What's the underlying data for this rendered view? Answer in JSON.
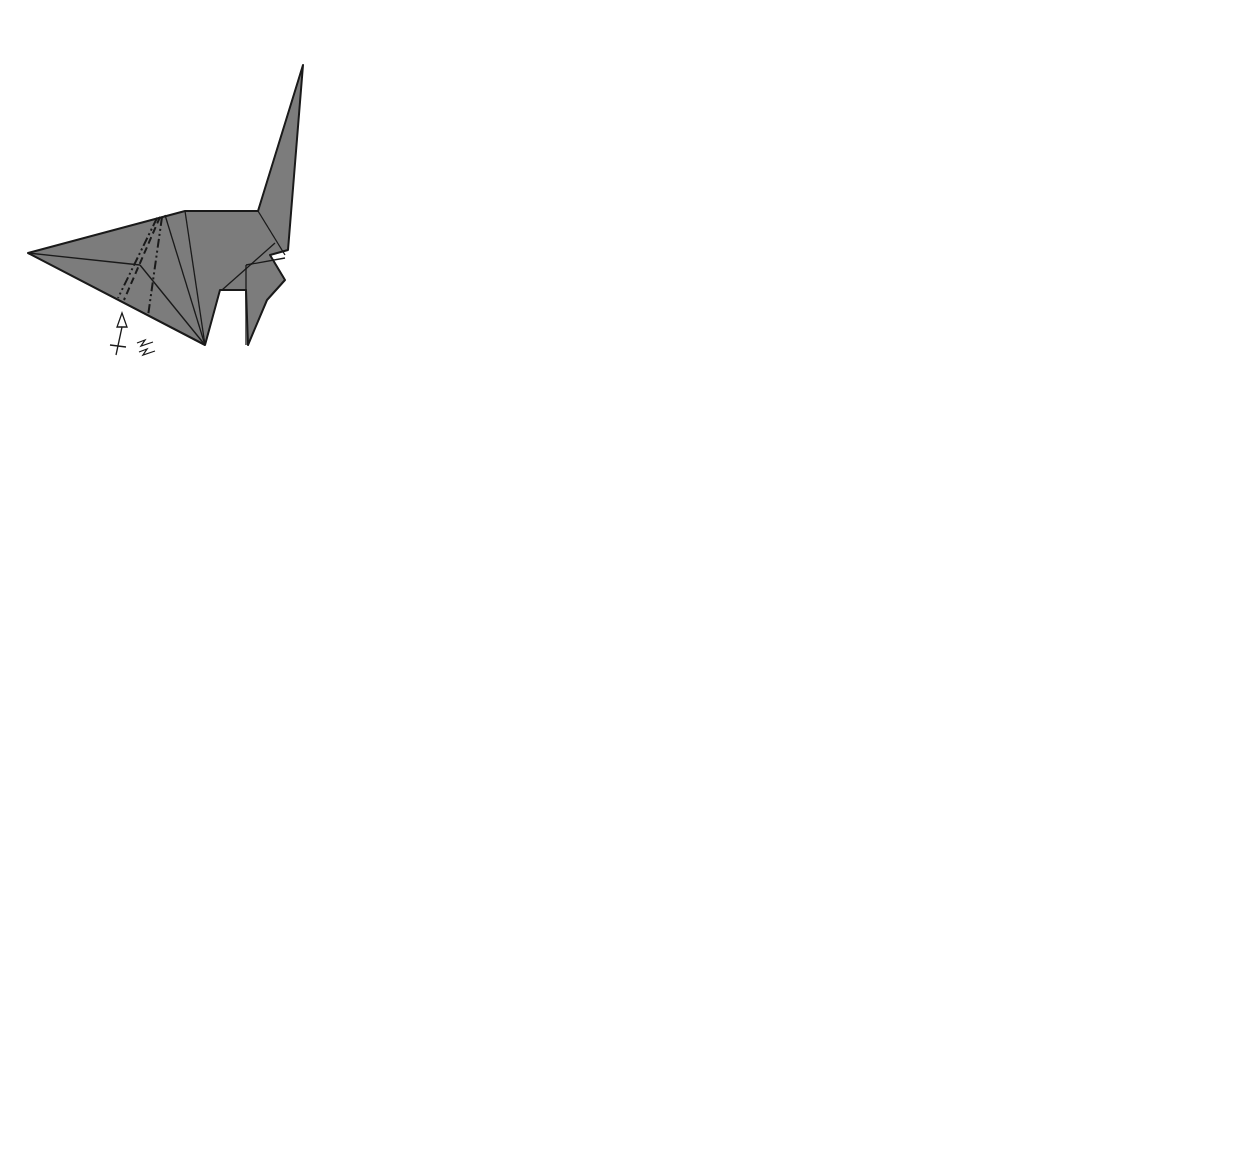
{
  "steps": [
    {
      "number": "40.",
      "label": "Create steps"
    },
    {
      "number": "41.",
      "label": "Push in"
    },
    {
      "number": "42.",
      "label": "Fold in"
    },
    {
      "number": "43.",
      "label": "Give shape"
    },
    {
      "number": "44.",
      "label": "Shape head"
    },
    {
      "number": "45.",
      "label": "Fold head"
    },
    {
      "number": "46.",
      "label": "Finished view"
    }
  ],
  "colors": {
    "paper": "#7c7c7c",
    "outline": "#1a1a1a",
    "footprint": "#d6d6d6",
    "background": "#ffffff"
  },
  "icons": [
    "push-arrow-icon",
    "turn-over-arrow-icon",
    "mountain-fold-line",
    "valley-fold-line",
    "zoom-circle-icon",
    "footprint-icon"
  ]
}
